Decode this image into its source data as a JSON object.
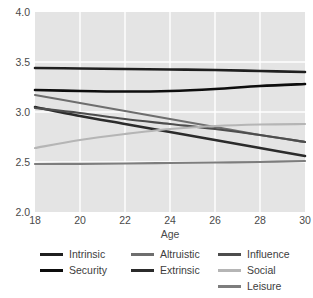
{
  "chart_data": {
    "type": "line",
    "title": "",
    "xlabel": "Age",
    "ylabel": "",
    "xlim": [
      18,
      30
    ],
    "ylim": [
      2.0,
      4.0
    ],
    "x_ticks": [
      "18",
      "20",
      "22",
      "24",
      "26",
      "28",
      "30"
    ],
    "x_tick_values": [
      18,
      20,
      22,
      24,
      26,
      28,
      30
    ],
    "y_ticks": [
      "2.0",
      "2.5",
      "3.0",
      "3.5",
      "4.0"
    ],
    "y_tick_values": [
      2.0,
      2.5,
      3.0,
      3.5,
      4.0
    ],
    "grid": "white gridlines on light grey panel",
    "legend_position": "bottom, three columns",
    "x": [
      18,
      20,
      22,
      24,
      26,
      28,
      30
    ],
    "series": [
      {
        "name": "Intrinsic",
        "color": "#1f1f1f",
        "width": 2.6,
        "values": [
          3.44,
          3.435,
          3.43,
          3.425,
          3.42,
          3.41,
          3.4
        ]
      },
      {
        "name": "Security",
        "color": "#0d0d0d",
        "width": 2.6,
        "values": [
          3.22,
          3.21,
          3.205,
          3.21,
          3.23,
          3.26,
          3.28
        ]
      },
      {
        "name": "Altruistic",
        "color": "#6e6e6e",
        "width": 2.2,
        "values": [
          3.17,
          3.09,
          3.01,
          2.93,
          2.85,
          2.77,
          2.7
        ]
      },
      {
        "name": "Extrinsic",
        "color": "#2b2b2b",
        "width": 2.6,
        "values": [
          3.05,
          2.96,
          2.88,
          2.8,
          2.72,
          2.64,
          2.56
        ]
      },
      {
        "name": "Influence",
        "color": "#4d4d4d",
        "width": 2.2,
        "values": [
          3.04,
          2.99,
          2.93,
          2.88,
          2.83,
          2.77,
          2.7
        ]
      },
      {
        "name": "Social",
        "color": "#b5b5b5",
        "width": 2.2,
        "values": [
          2.64,
          2.72,
          2.78,
          2.83,
          2.86,
          2.875,
          2.88
        ]
      },
      {
        "name": "Leisure",
        "color": "#7d7d7d",
        "width": 2.2,
        "values": [
          2.48,
          2.482,
          2.485,
          2.49,
          2.495,
          2.5,
          2.51
        ]
      }
    ]
  },
  "axes": {
    "x_label": "Age",
    "x_tick_labels": [
      "18",
      "20",
      "22",
      "24",
      "26",
      "28",
      "30"
    ],
    "y_tick_labels": [
      "4.0",
      "3.5",
      "3.0",
      "2.5",
      "2.0"
    ]
  },
  "legend": {
    "columns": [
      {
        "entries": [
          {
            "label": "Intrinsic",
            "color": "#1f1f1f"
          },
          {
            "label": "Security",
            "color": "#0d0d0d"
          }
        ]
      },
      {
        "entries": [
          {
            "label": "Altruistic",
            "color": "#6e6e6e"
          },
          {
            "label": "Extrinsic",
            "color": "#2b2b2b"
          }
        ]
      },
      {
        "entries": [
          {
            "label": "Influence",
            "color": "#4d4d4d"
          },
          {
            "label": "Social",
            "color": "#b5b5b5"
          },
          {
            "label": "Leisure",
            "color": "#7d7d7d"
          }
        ]
      }
    ]
  },
  "style": {
    "panel_bg": "#e4e4e4",
    "grid_color": "#ffffff",
    "page_bg": "#ffffff",
    "text_color": "#3d3d3d"
  }
}
